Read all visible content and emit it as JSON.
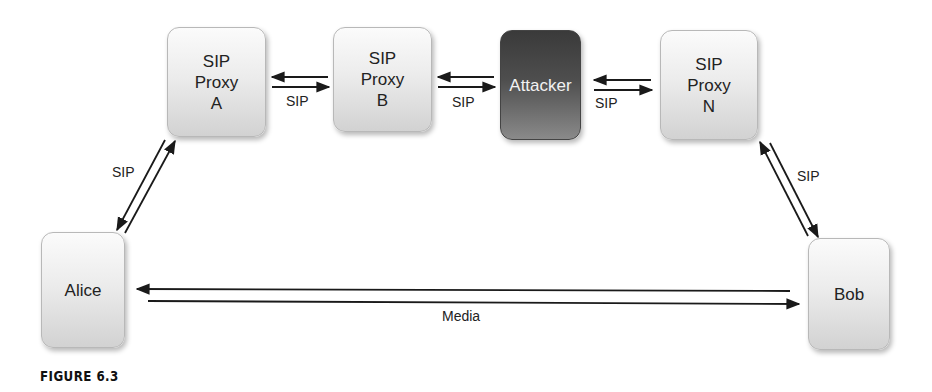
{
  "nodes": {
    "proxy_a": {
      "label": "SIP\nProxy\nA"
    },
    "proxy_b": {
      "label": "SIP\nProxy\nB"
    },
    "attacker": {
      "label": "Attacker"
    },
    "proxy_n": {
      "label": "SIP\nProxy\nN"
    },
    "alice": {
      "label": "Alice"
    },
    "bob": {
      "label": "Bob"
    }
  },
  "edges": {
    "alice_proxy_a": {
      "label": "SIP",
      "direction": "bidirectional"
    },
    "proxy_a_proxy_b": {
      "label": "SIP",
      "direction": "bidirectional"
    },
    "proxy_b_attacker": {
      "label": "SIP",
      "direction": "bidirectional"
    },
    "attacker_proxy_n": {
      "label": "SIP",
      "direction": "bidirectional"
    },
    "proxy_n_bob": {
      "label": "SIP",
      "direction": "bidirectional"
    },
    "alice_bob": {
      "label": "Media",
      "direction": "bidirectional"
    }
  },
  "caption": "FIGURE 6.3",
  "colors": {
    "node_light": "#ececec",
    "node_dark": "#4e4e4e",
    "arrow": "#1a1a1a"
  }
}
